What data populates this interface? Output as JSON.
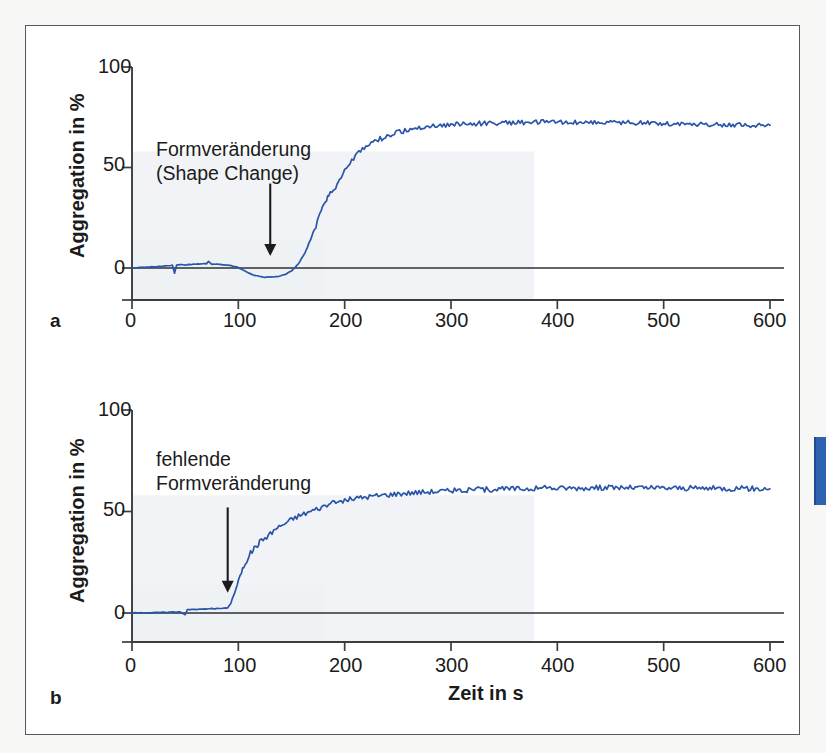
{
  "figure": {
    "panels": [
      {
        "letter": "a",
        "annotation_lines": [
          "Formveränderung",
          "(Shape Change)"
        ]
      },
      {
        "letter": "b",
        "annotation_lines": [
          "fehlende",
          "Formveränderung"
        ]
      }
    ],
    "shared_xlabel": "Zeit in s",
    "colors": {
      "trace": "#2a55a8",
      "axis": "#3a3c40",
      "frame": "#55585c",
      "plot_tint": "#eef1f4",
      "edge_tab": "#2f63b2",
      "page": "#f7f7f5"
    }
  },
  "chart_data": [
    {
      "type": "line",
      "title": "",
      "subtitle": "a",
      "xlabel": "",
      "ylabel": "Aggregation in %",
      "xlim": [
        0,
        600
      ],
      "ylim": [
        -15,
        100
      ],
      "xticks": [
        0,
        100,
        200,
        300,
        400,
        500,
        600
      ],
      "xtick_labels": [
        "0",
        "100",
        "200",
        "300",
        "400",
        "500",
        "600"
      ],
      "yticks": [
        0,
        50,
        100
      ],
      "ytick_labels": [
        "0",
        "50",
        "100"
      ],
      "grid": false,
      "legend": "none",
      "annotations": [
        {
          "text": "Formveränderung\n(Shape Change)",
          "arrow_from_x": 130,
          "arrow_from_y": 42,
          "arrow_to_x": 130,
          "arrow_to_y": 6
        }
      ],
      "series": [
        {
          "name": "Aggregation (Shape Change vorhanden)",
          "x": [
            0,
            10,
            20,
            30,
            35,
            38,
            40,
            42,
            45,
            50,
            55,
            60,
            65,
            68,
            70,
            72,
            75,
            78,
            80,
            85,
            90,
            95,
            100,
            105,
            110,
            115,
            120,
            125,
            130,
            135,
            140,
            145,
            150,
            155,
            158,
            160,
            163,
            165,
            168,
            170,
            173,
            175,
            178,
            180,
            183,
            185,
            188,
            190,
            193,
            195,
            200,
            205,
            210,
            215,
            220,
            225,
            230,
            235,
            240,
            245,
            250,
            255,
            260,
            265,
            270,
            275,
            280,
            290,
            300,
            310,
            320,
            330,
            340,
            350,
            360,
            370,
            380,
            390,
            400,
            410,
            420,
            430,
            440,
            450,
            460,
            470,
            480,
            490,
            500,
            510,
            520,
            530,
            540,
            550,
            560,
            570,
            580,
            590,
            600
          ],
          "y": [
            0,
            0.3,
            0.6,
            0.9,
            1.1,
            1.3,
            -2.6,
            1.4,
            1.6,
            1.5,
            1.8,
            2.0,
            1.9,
            2.1,
            2.0,
            3.2,
            1.9,
            2.0,
            1.9,
            1.7,
            1.4,
            0.9,
            0.2,
            -1.2,
            -2.6,
            -3.6,
            -4.2,
            -4.5,
            -4.5,
            -4.3,
            -3.8,
            -2.9,
            -1.4,
            1.2,
            3.2,
            5.0,
            8.0,
            10.5,
            14.0,
            17.0,
            21.0,
            24.0,
            28.0,
            31.0,
            34.5,
            36.5,
            38.0,
            39.0,
            41.5,
            44.0,
            48.5,
            52.0,
            55.5,
            58.0,
            60.5,
            62.0,
            63.5,
            64.5,
            65.5,
            66.5,
            67.5,
            68.0,
            68.8,
            69.2,
            69.8,
            70.2,
            70.5,
            71.0,
            71.3,
            71.6,
            71.8,
            72.0,
            72.1,
            72.3,
            72.4,
            72.5,
            72.5,
            72.6,
            72.6,
            72.5,
            72.6,
            72.5,
            72.4,
            72.5,
            72.4,
            72.3,
            72.2,
            72.1,
            72.0,
            71.8,
            71.7,
            71.6,
            71.5,
            71.4,
            71.3,
            71.2,
            71.1,
            71.0,
            71.0
          ],
          "plateau_value": 72,
          "noise_amplitude": 1.2
        }
      ]
    },
    {
      "type": "line",
      "title": "",
      "subtitle": "b",
      "xlabel": "Zeit in s",
      "ylabel": "Aggregation in %",
      "xlim": [
        0,
        600
      ],
      "ylim": [
        -15,
        100
      ],
      "xticks": [
        0,
        100,
        200,
        300,
        400,
        500,
        600
      ],
      "xtick_labels": [
        "0",
        "100",
        "200",
        "300",
        "400",
        "500",
        "600"
      ],
      "yticks": [
        0,
        50,
        100
      ],
      "ytick_labels": [
        "0",
        "50",
        "100"
      ],
      "grid": false,
      "legend": "none",
      "annotations": [
        {
          "text": "fehlende\nFormveränderung",
          "arrow_from_x": 90,
          "arrow_from_y": 52,
          "arrow_to_x": 90,
          "arrow_to_y": 10
        }
      ],
      "series": [
        {
          "name": "Aggregation (fehlende Formveränderung)",
          "x": [
            0,
            10,
            20,
            30,
            40,
            45,
            50,
            52,
            55,
            58,
            60,
            65,
            70,
            75,
            80,
            85,
            88,
            90,
            93,
            95,
            98,
            100,
            103,
            105,
            108,
            110,
            113,
            115,
            118,
            120,
            125,
            130,
            135,
            140,
            145,
            150,
            155,
            160,
            165,
            170,
            175,
            180,
            185,
            190,
            195,
            200,
            210,
            220,
            230,
            240,
            250,
            260,
            270,
            280,
            290,
            300,
            310,
            320,
            330,
            340,
            350,
            360,
            370,
            380,
            390,
            400,
            410,
            420,
            430,
            440,
            450,
            460,
            470,
            480,
            490,
            500,
            510,
            520,
            530,
            540,
            550,
            560,
            570,
            580,
            590,
            600
          ],
          "y": [
            0,
            0.1,
            0.2,
            0.3,
            0.5,
            0.6,
            -0.8,
            1.6,
            1.7,
            1.8,
            1.8,
            1.9,
            2.0,
            2.1,
            2.2,
            2.3,
            2.4,
            2.5,
            5.0,
            8.0,
            12.0,
            16.0,
            20.0,
            23.0,
            26.0,
            28.5,
            30.5,
            32.0,
            33.5,
            35.0,
            37.0,
            39.0,
            41.5,
            43.0,
            44.5,
            46.0,
            47.5,
            48.5,
            49.5,
            50.5,
            51.5,
            52.5,
            53.5,
            54.0,
            54.8,
            55.5,
            56.5,
            57.2,
            57.8,
            58.3,
            58.8,
            59.2,
            59.5,
            59.8,
            60.0,
            60.2,
            60.4,
            60.6,
            60.8,
            61.0,
            61.1,
            61.2,
            61.3,
            61.4,
            61.5,
            61.5,
            61.6,
            61.6,
            61.7,
            61.7,
            61.8,
            61.8,
            61.7,
            61.7,
            61.6,
            61.6,
            61.6,
            61.5,
            61.5,
            61.5,
            61.4,
            61.4,
            61.3,
            61.3,
            61.2,
            61.2
          ],
          "plateau_value": 61,
          "noise_amplitude": 1.3
        }
      ]
    }
  ]
}
